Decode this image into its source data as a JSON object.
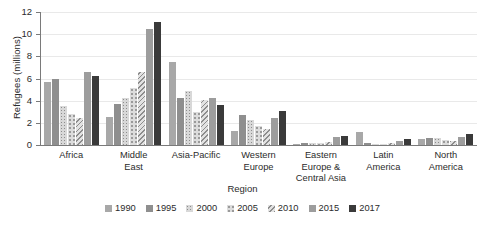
{
  "chart_data": {
    "type": "bar",
    "title": "",
    "xlabel": "Region",
    "ylabel": "Refugees (millions)",
    "ylim": [
      0,
      12
    ],
    "yticks": [
      0,
      2,
      4,
      6,
      8,
      10,
      12
    ],
    "grid": true,
    "legend_position": "bottom",
    "categories": [
      "Africa",
      "Middle\nEast",
      "Asia-Pacific",
      "Western\nEurope",
      "Eastern\nEurope &\nCentral Asia",
      "Latin\nAmerica",
      "North\nAmerica"
    ],
    "series": [
      {
        "name": "1990",
        "color": "#a8a8a8",
        "pattern": "solid",
        "values": [
          5.7,
          2.5,
          7.5,
          1.3,
          0.1,
          1.2,
          0.5
        ]
      },
      {
        "name": "1995",
        "color": "#8f8f8f",
        "pattern": "solid",
        "values": [
          6.0,
          3.7,
          4.2,
          2.7,
          0.2,
          0.15,
          0.65
        ]
      },
      {
        "name": "2000",
        "color": "#d8d8d8",
        "pattern": "fine-dots",
        "values": [
          3.55,
          4.2,
          4.9,
          2.3,
          0.15,
          0.1,
          0.6
        ]
      },
      {
        "name": "2005",
        "color": "#dcdcdc",
        "pattern": "coarse-dots",
        "values": [
          2.8,
          5.1,
          3.0,
          1.75,
          0.2,
          0.1,
          0.45
        ]
      },
      {
        "name": "2010",
        "color": "#e2e2e2",
        "pattern": "diagonal-hatch",
        "values": [
          2.4,
          6.6,
          4.05,
          1.4,
          0.25,
          0.15,
          0.4
        ]
      },
      {
        "name": "2015",
        "color": "#9d9d9d",
        "pattern": "solid",
        "values": [
          6.6,
          10.5,
          4.2,
          2.45,
          0.7,
          0.4,
          0.75
        ]
      },
      {
        "name": "2017",
        "color": "#3a3a3a",
        "pattern": "solid",
        "values": [
          6.25,
          11.1,
          3.65,
          3.1,
          0.8,
          0.5,
          1.0
        ]
      }
    ]
  }
}
